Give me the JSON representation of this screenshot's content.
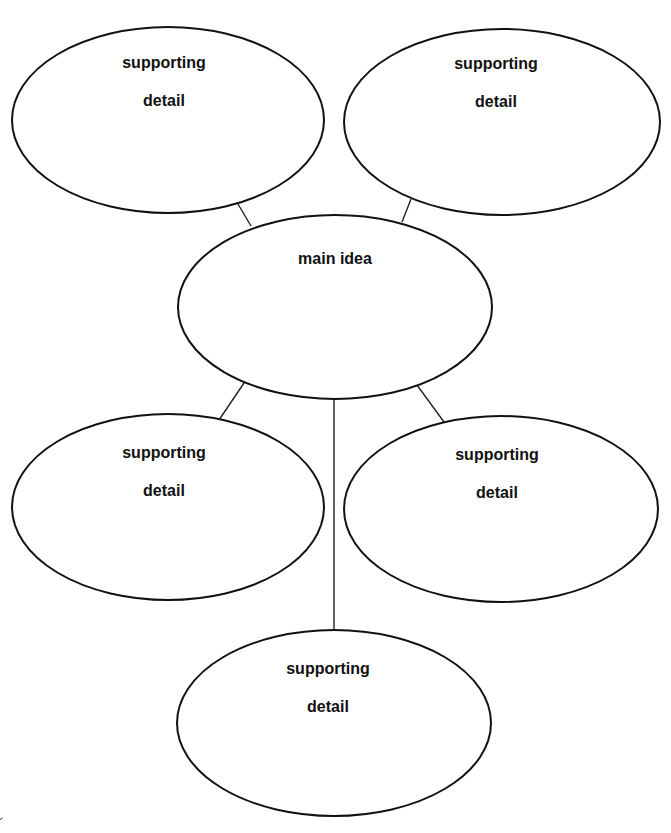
{
  "diagram": {
    "type": "main-idea web graphic organizer",
    "colors": {
      "stroke": "#111111",
      "background": "#ffffff",
      "text": "#111111"
    },
    "main_idea": {
      "label": "main idea"
    },
    "supporting_details": [
      {
        "position": "top-left",
        "line1": "supporting",
        "line2": "detail"
      },
      {
        "position": "top-right",
        "line1": "supporting",
        "line2": "detail"
      },
      {
        "position": "middle-left",
        "line1": "supporting",
        "line2": "detail"
      },
      {
        "position": "middle-right",
        "line1": "supporting",
        "line2": "detail"
      },
      {
        "position": "bottom-center",
        "line1": "supporting",
        "line2": "detail"
      }
    ]
  }
}
